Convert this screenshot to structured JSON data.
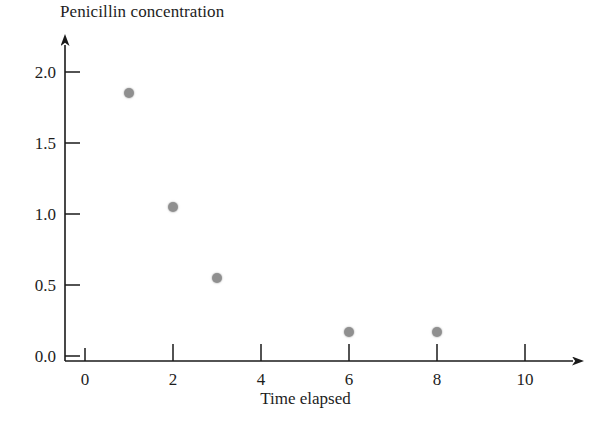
{
  "chart_data": {
    "type": "scatter",
    "title": "Penicillin concentration",
    "xlabel": "Time elapsed",
    "ylabel": "",
    "x": [
      1,
      2,
      3,
      6,
      8
    ],
    "values": [
      1.85,
      1.05,
      0.55,
      0.17,
      0.17
    ],
    "series": [
      {
        "name": "Penicillin concentration",
        "points": [
          {
            "x": 1,
            "y": 1.85
          },
          {
            "x": 2,
            "y": 1.05
          },
          {
            "x": 3,
            "y": 0.55
          },
          {
            "x": 6,
            "y": 0.17
          },
          {
            "x": 8,
            "y": 0.17
          }
        ]
      }
    ],
    "xlim": [
      0,
      11.4
    ],
    "ylim": [
      0,
      2.25
    ],
    "xticks": [
      "0",
      "2",
      "4",
      "6",
      "8",
      "10"
    ],
    "xtick_values": [
      0,
      2,
      4,
      6,
      8,
      10
    ],
    "yticks": [
      "0.0",
      "0.5",
      "1.0",
      "1.5",
      "2.0"
    ],
    "ytick_values": [
      0.0,
      0.5,
      1.0,
      1.5,
      2.0
    ],
    "grid": false,
    "legend": "none",
    "marker_color": "#8f8f8f",
    "axis_color": "#1a1a1a",
    "background_color": "#ffffff",
    "axis_style": "arrow-terminated"
  },
  "labels": {
    "y": {
      "t0": "0.0",
      "t1": "0.5",
      "t2": "1.0",
      "t3": "1.5",
      "t4": "2.0"
    },
    "x": {
      "t0": "0",
      "t1": "2",
      "t2": "4",
      "t3": "6",
      "t4": "8",
      "t5": "10"
    }
  }
}
